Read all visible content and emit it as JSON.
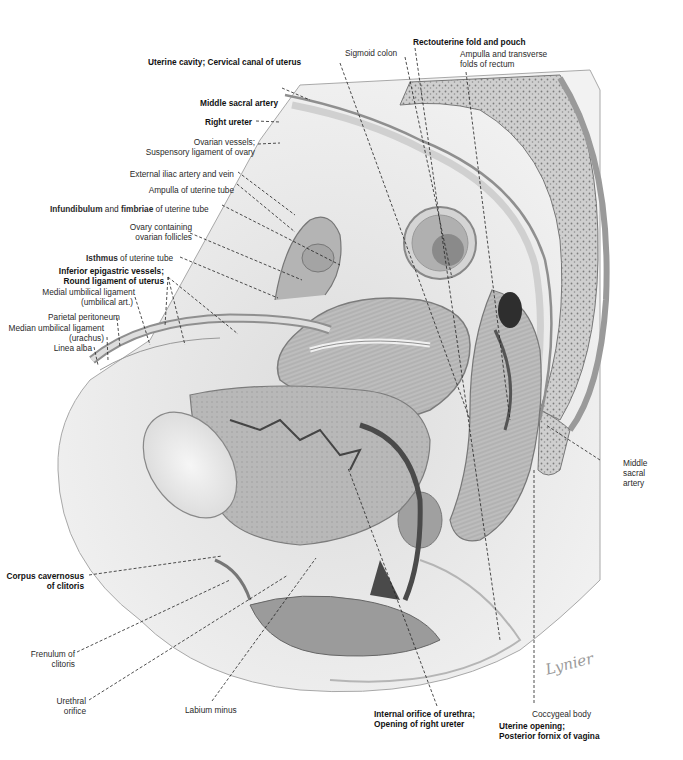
{
  "figure": {
    "type": "anatomical-illustration",
    "signature": "Lynier"
  },
  "labels": {
    "uterine_cavity": {
      "text": "Uterine cavity; Cervical canal of uterus",
      "bold": true
    },
    "sigmoid_colon": {
      "text": "Sigmoid colon",
      "bold": false
    },
    "rectouterine": {
      "text": "Rectouterine fold and pouch",
      "bold": true
    },
    "ampulla_rectum_1": {
      "text": "Ampulla and transverse",
      "bold": false
    },
    "ampulla_rectum_2": {
      "text": "folds of rectum",
      "bold": false
    },
    "middle_sacral_artery_top": {
      "text": "Middle sacral artery",
      "bold": true
    },
    "right_ureter": {
      "text": "Right ureter",
      "bold": true
    },
    "ovarian_vessels_1": {
      "text": "Ovarian vessels;",
      "bold": false
    },
    "ovarian_vessels_2": {
      "text": "Suspensory ligament of ovary",
      "bold": false
    },
    "external_iliac": {
      "text": "External iliac artery and vein",
      "bold": false
    },
    "ampulla_tube": {
      "text": "Ampulla of uterine tube",
      "bold": false
    },
    "infundibulum_a": {
      "text": "Infundibulum",
      "bold": true
    },
    "infundibulum_b": {
      "text": " and ",
      "bold": false
    },
    "infundibulum_c": {
      "text": "fimbriae",
      "bold": true
    },
    "infundibulum_d": {
      "text": " of uterine tube",
      "bold": false
    },
    "ovary_1": {
      "text": "Ovary containing",
      "bold": false
    },
    "ovary_2": {
      "text": "ovarian follicles",
      "bold": false
    },
    "isthmus_a": {
      "text": "Isthmus",
      "bold": true
    },
    "isthmus_b": {
      "text": " of uterine tube",
      "bold": false
    },
    "inferior_epigastric_1": {
      "text": "Inferior epigastric vessels;",
      "bold": true
    },
    "inferior_epigastric_2": {
      "text": "Round ligament of uterus",
      "bold": true
    },
    "medial_umbilical_1": {
      "text": "Medial umbilical ligament",
      "bold": false
    },
    "medial_umbilical_2": {
      "text": "(umbilical art.)",
      "bold": false
    },
    "parietal_peritoneum": {
      "text": "Parietal peritoneum",
      "bold": false
    },
    "median_umbilical_1": {
      "text": "Median umbilical ligament",
      "bold": false
    },
    "median_umbilical_2": {
      "text": "(urachus)",
      "bold": false
    },
    "linea_alba": {
      "text": "Linea alba",
      "bold": false
    },
    "middle_sacral_artery_right_1": {
      "text": "Middle",
      "bold": false
    },
    "middle_sacral_artery_right_2": {
      "text": "sacral",
      "bold": false
    },
    "middle_sacral_artery_right_3": {
      "text": "artery",
      "bold": false
    },
    "corpus_cavernosus_1": {
      "text": "Corpus cavernosus",
      "bold": true
    },
    "corpus_cavernosus_2": {
      "text": "of clitoris",
      "bold": true
    },
    "frenulum_1": {
      "text": "Frenulum of",
      "bold": false
    },
    "frenulum_2": {
      "text": "clitoris",
      "bold": false
    },
    "urethral_orifice_1": {
      "text": "Urethral",
      "bold": false
    },
    "urethral_orifice_2": {
      "text": "orifice",
      "bold": false
    },
    "labium_minus": {
      "text": "Labium minus",
      "bold": false
    },
    "internal_orifice_1": {
      "text": "Internal orifice of urethra;",
      "bold": true
    },
    "internal_orifice_2": {
      "text": "Opening of right ureter",
      "bold": true
    },
    "coccygeal_body": {
      "text": "Coccygeal body",
      "bold": false
    },
    "uterine_opening_1": {
      "text": "Uterine opening;",
      "bold": true
    },
    "uterine_opening_2": {
      "text": "Posterior fornix of vagina",
      "bold": true
    }
  },
  "colors": {
    "background": "#ffffff",
    "tissue_light": "#e4e4e4",
    "tissue_mid": "#c4c4c4",
    "tissue_dark": "#8a8a8a",
    "label_text": "#1a1a1a",
    "leader_line": "#222222"
  }
}
